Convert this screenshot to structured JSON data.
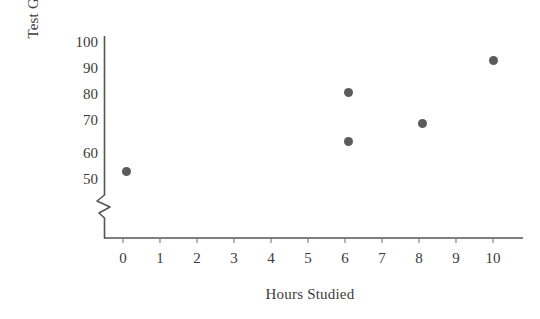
{
  "chart_data": {
    "type": "scatter",
    "title": "",
    "xlabel": "Hours Studied",
    "ylabel": "Test Grade",
    "xlim": [
      -0.5,
      10.6
    ],
    "ylim": [
      45,
      103
    ],
    "y_axis_break": true,
    "grid": false,
    "legend": null,
    "marker_color": "#5b5b5b",
    "axis_color": "#555555",
    "xticks": [
      "0",
      "1",
      "2",
      "3",
      "4",
      "5",
      "6",
      "7",
      "8",
      "9",
      "10"
    ],
    "xtick_values": [
      0,
      1,
      2,
      3,
      4,
      5,
      6,
      7,
      8,
      9,
      10
    ],
    "yticks": [
      "50",
      "60",
      "70",
      "80",
      "90",
      "100"
    ],
    "ytick_values": [
      50,
      60,
      70,
      80,
      90,
      100
    ],
    "x": [
      0.1,
      6.1,
      6.1,
      8.1,
      10.0
    ],
    "y": [
      52.5,
      83.0,
      64.0,
      71.0,
      95.0
    ],
    "points": [
      {
        "x": 0.1,
        "y": 52.5
      },
      {
        "x": 6.1,
        "y": 83.0
      },
      {
        "x": 6.1,
        "y": 64.0
      },
      {
        "x": 8.1,
        "y": 71.0
      },
      {
        "x": 10.0,
        "y": 95.0
      }
    ]
  },
  "axes": {
    "y_title": "Test Grade",
    "x_title": "Hours Studied"
  },
  "ticks": {
    "y": [
      {
        "label": "100"
      },
      {
        "label": "90"
      },
      {
        "label": "80"
      },
      {
        "label": "70"
      },
      {
        "label": "60"
      },
      {
        "label": "50"
      }
    ],
    "x": [
      {
        "label": "0"
      },
      {
        "label": "1"
      },
      {
        "label": "2"
      },
      {
        "label": "3"
      },
      {
        "label": "4"
      },
      {
        "label": "5"
      },
      {
        "label": "6"
      },
      {
        "label": "7"
      },
      {
        "label": "8"
      },
      {
        "label": "9"
      },
      {
        "label": "10"
      }
    ]
  }
}
